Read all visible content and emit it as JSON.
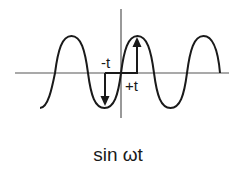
{
  "diagram": {
    "title": "sin ωt",
    "labels": {
      "minus_t": "-t",
      "plus_t": "+t",
      "caption": "sin ωt"
    },
    "colors": {
      "curve": "#1a1a1a",
      "axis": "#555555",
      "arrow": "#1a1a1a",
      "background": "#ffffff"
    },
    "elements": [
      {
        "type": "axis",
        "orientation": "horizontal"
      },
      {
        "type": "axis",
        "orientation": "vertical"
      },
      {
        "type": "curve",
        "function": "sine"
      },
      {
        "type": "arrow",
        "direction": "up",
        "label": "+t"
      },
      {
        "type": "arrow",
        "direction": "down",
        "label": "-t"
      }
    ]
  }
}
